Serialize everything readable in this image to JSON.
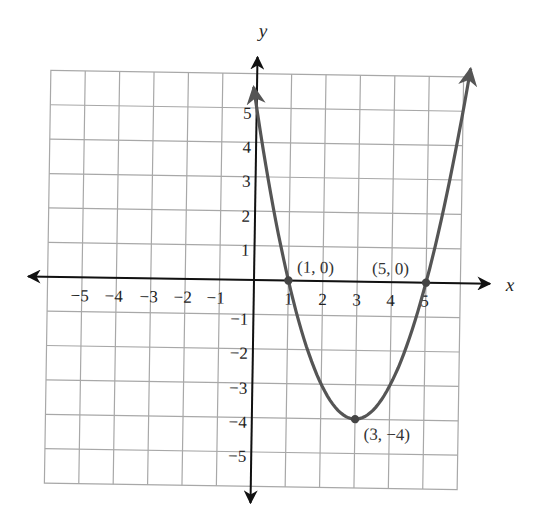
{
  "chart_data": {
    "type": "line",
    "title": "",
    "xlabel": "x",
    "ylabel": "y",
    "xlim": [
      -6,
      6
    ],
    "ylim": [
      -6,
      6
    ],
    "grid": true,
    "x_ticks": [
      "-5",
      "-4",
      "-3",
      "-2",
      "-1",
      "1",
      "2",
      "3",
      "4",
      "5"
    ],
    "y_ticks": [
      "5",
      "4",
      "3",
      "2",
      "1",
      "-1",
      "-2",
      "-3",
      "-4",
      "-5"
    ],
    "series": [
      {
        "name": "y = x^2 - 6x + 5",
        "color": "#555555",
        "x": [
          -0.1,
          0,
          0.5,
          1,
          1.5,
          2,
          2.5,
          3,
          3.5,
          4,
          4.5,
          5,
          5.5,
          6,
          6.2
        ],
        "y": [
          5.61,
          5,
          2.25,
          0,
          -1.75,
          -3,
          -3.75,
          -4,
          -3.75,
          -3,
          -1.75,
          0,
          2.25,
          5,
          6.24
        ]
      }
    ],
    "points": [
      {
        "x": 1,
        "y": 0,
        "label": "(1, 0)"
      },
      {
        "x": 5,
        "y": 0,
        "label": "(5, 0)"
      },
      {
        "x": 3,
        "y": -4,
        "label": "(3, −4)"
      }
    ]
  },
  "labels": {
    "x_axis": "x",
    "y_axis": "y",
    "pt1": "(1, 0)",
    "pt2": "(5, 0)",
    "pt3": "(3, −4)",
    "xt_m5": "−5",
    "xt_m4": "−4",
    "xt_m3": "−3",
    "xt_m2": "−2",
    "xt_m1": "−1",
    "xt_1": "1",
    "xt_2": "2",
    "xt_3": "3",
    "xt_4": "4",
    "xt_5": "5",
    "yt_5": "5",
    "yt_4": "4",
    "yt_3": "3",
    "yt_2": "2",
    "yt_1": "1",
    "yt_m1": "−1",
    "yt_m2": "−2",
    "yt_m3": "−3",
    "yt_m4": "−4",
    "yt_m5": "−5"
  }
}
